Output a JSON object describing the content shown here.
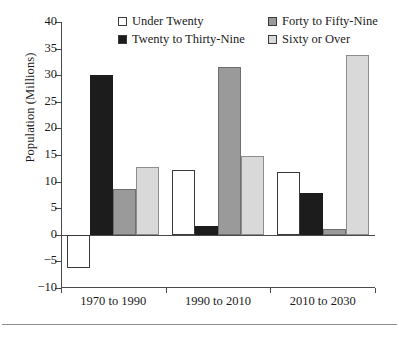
{
  "chart_data": {
    "type": "bar",
    "title": "",
    "subtitle": "",
    "xlabel": "",
    "ylabel": "Population (Millions)",
    "ylim": [
      -10,
      40
    ],
    "yticks": [
      40,
      35,
      30,
      25,
      20,
      15,
      10,
      5,
      0,
      -5,
      -10
    ],
    "ytick_labels": [
      "40",
      "35",
      "30",
      "25",
      "20",
      "15",
      "10",
      "5",
      "0",
      "−5",
      "−10"
    ],
    "grid": false,
    "legend_position": "top-inside",
    "categories": [
      "1970 to 1990",
      "1990 to 2010",
      "2010 to 2030"
    ],
    "series": [
      {
        "name": "Under Twenty",
        "color": "#ffffff",
        "edge_color": "#3a3a3a",
        "values": [
          -6.2,
          12.1,
          11.8
        ]
      },
      {
        "name": "Twenty to Thirty-Nine",
        "color": "#1c1c1c",
        "edge_color": "#1c1c1c",
        "values": [
          30.0,
          1.6,
          7.8
        ]
      },
      {
        "name": "Forty to Fifty-Nine",
        "color": "#9a9a9a",
        "edge_color": "#6e6e6e",
        "values": [
          8.7,
          31.5,
          1.1
        ]
      },
      {
        "name": "Sixty or Over",
        "color": "#d9d9d9",
        "edge_color": "#8d8d8d",
        "values": [
          12.7,
          14.8,
          33.8
        ]
      }
    ]
  },
  "axis": {
    "zero_label": "0",
    "line_color": "#4a4a4a"
  },
  "legend": {
    "entries": [
      {
        "label": "Under Twenty",
        "swatch": "#ffffff"
      },
      {
        "label": "Forty to Fifty-Nine",
        "swatch": "#9a9a9a"
      },
      {
        "label": "Twenty to Thirty-Nine",
        "swatch": "#1c1c1c"
      },
      {
        "label": "Sixty or Over",
        "swatch": "#d9d9d9"
      }
    ]
  }
}
